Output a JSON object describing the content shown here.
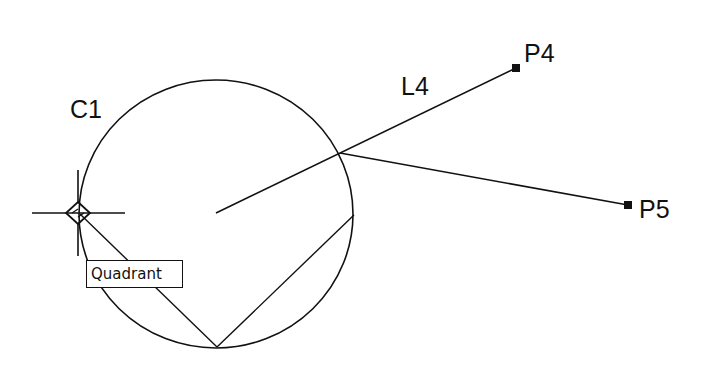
{
  "drawing": {
    "stroke_color": "#111111",
    "background": "#ffffff",
    "circle": {
      "label": "C1",
      "cx": 216,
      "cy": 214,
      "rx": 137,
      "ry": 134
    },
    "line": {
      "label": "L4"
    },
    "points": [
      {
        "label": "P4",
        "x": 516,
        "y": 68
      },
      {
        "label": "P5",
        "x": 628,
        "y": 205
      }
    ]
  },
  "osnap": {
    "marker": "quadrant",
    "tooltip": "Quadrant",
    "cursor": {
      "x": 78,
      "y": 213
    }
  }
}
